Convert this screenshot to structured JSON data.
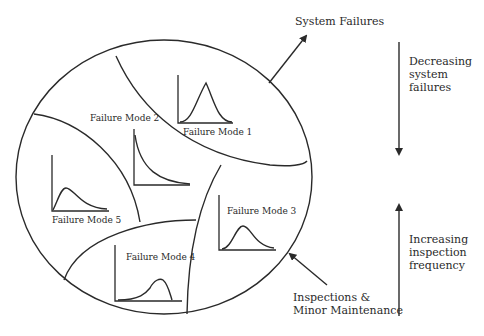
{
  "diagram": {
    "system_failures_label": "System Failures",
    "inspections_label_line1": "Inspections &",
    "inspections_label_line2": "Minor Maintenance",
    "decreasing": [
      "Decreasing",
      "system",
      "failures"
    ],
    "increasing": [
      "Increasing",
      "inspection",
      "frequency"
    ],
    "failure_modes": [
      {
        "label": "Failure Mode 1",
        "distribution": "bell-shaped"
      },
      {
        "label": "Failure Mode 2",
        "distribution": "decreasing-exponential"
      },
      {
        "label": "Failure Mode 3",
        "distribution": "bell-shaped"
      },
      {
        "label": "Failure Mode 4",
        "distribution": "left-skewed"
      },
      {
        "label": "Failure Mode 5",
        "distribution": "right-skewed"
      }
    ]
  }
}
